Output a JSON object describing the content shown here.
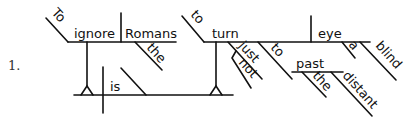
{
  "diagram": {
    "type": "Reed-Kellogg sentence diagram",
    "item_number": "1.",
    "sentence": "To ignore the Romans is to turn a blind eye not just to the distant past.",
    "subject": {
      "infinitive_marker": "To",
      "verb": "ignore",
      "object": "Romans",
      "object_modifier": "the"
    },
    "verb": "is",
    "predicate_nominative": {
      "infinitive_marker": "to",
      "verb": "turn",
      "object": "eye",
      "object_modifiers": [
        "a",
        "blind"
      ],
      "adverb": "just",
      "adverb_modifier": "not",
      "preposition": "to",
      "prep_object": "past",
      "prep_object_modifiers": [
        "the",
        "distant"
      ]
    }
  }
}
